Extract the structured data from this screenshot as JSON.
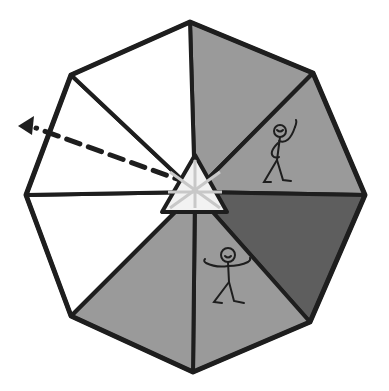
{
  "illustration": {
    "subject": "octagonal umbrella/tent viewed from above with stick figures",
    "width": 389,
    "height": 391,
    "center": [
      195,
      192
    ],
    "vertices": [
      [
        190,
        22
      ],
      [
        313,
        73
      ],
      [
        365,
        195
      ],
      [
        310,
        322
      ],
      [
        193,
        372
      ],
      [
        71,
        316
      ],
      [
        26,
        195
      ],
      [
        71,
        75
      ]
    ],
    "segments": [
      {
        "name": "segment-top-right-upper",
        "fill": "#9a9a9a"
      },
      {
        "name": "segment-right-upper",
        "fill": "#9a9a9a",
        "figure": "waving-stick-figure"
      },
      {
        "name": "segment-right-lower",
        "fill": "#5e5e5e"
      },
      {
        "name": "segment-bottom-right",
        "fill": "#9a9a9a",
        "figure": "open-arms-stick-figure"
      },
      {
        "name": "segment-bottom-left",
        "fill": "#9a9a9a"
      },
      {
        "name": "segment-left-lower",
        "fill": "#ffffff"
      },
      {
        "name": "segment-left-upper",
        "fill": "#ffffff"
      },
      {
        "name": "segment-top-left",
        "fill": "#ffffff"
      }
    ],
    "hub": {
      "shape": "triangle",
      "points": [
        [
          195,
          155
        ],
        [
          162,
          212
        ],
        [
          227,
          212
        ]
      ],
      "fill": "#f2f2f2"
    },
    "arrow": {
      "style": "dashed",
      "from": [
        190,
        182
      ],
      "to": [
        20,
        127
      ]
    },
    "colors": {
      "stroke": "#1e1e1e",
      "light_gray": "#9a9a9a",
      "dark_gray": "#5e5e5e",
      "white": "#ffffff",
      "hub_lines": "#c8c8c8"
    }
  }
}
